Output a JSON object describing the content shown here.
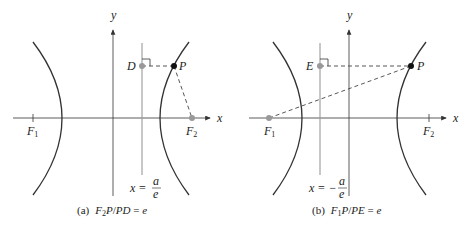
{
  "panels": [
    {
      "id": "a",
      "caption_tag": "(a)",
      "caption_parts": {
        "num": "F",
        "num_sub": "2",
        "num_rest": "P",
        "slash": "/",
        "den": "PD",
        "eq": " = ",
        "e": "e"
      },
      "axis_labels": {
        "x": "x",
        "y": "y"
      },
      "foci": [
        {
          "label": "F",
          "sub": "1",
          "marked": false
        },
        {
          "label": "F",
          "sub": "2",
          "marked": true
        }
      ],
      "point_P": "P",
      "point_on_directrix": "D",
      "directrix": {
        "lhs": "x = ",
        "sign": "",
        "num": "a",
        "den": "e"
      }
    },
    {
      "id": "b",
      "caption_tag": "(b)",
      "caption_parts": {
        "num": "F",
        "num_sub": "1",
        "num_rest": "P",
        "slash": "/",
        "den": "PE",
        "eq": " = ",
        "e": "e"
      },
      "axis_labels": {
        "x": "x",
        "y": "y"
      },
      "foci": [
        {
          "label": "F",
          "sub": "1",
          "marked": true
        },
        {
          "label": "F",
          "sub": "2",
          "marked": false
        }
      ],
      "point_P": "P",
      "point_on_directrix": "E",
      "directrix": {
        "lhs": "x = ",
        "sign": "−",
        "num": "a",
        "den": "e"
      }
    }
  ],
  "colors": {
    "curve": "#333333",
    "axis": "#333333",
    "directrix": "#999999",
    "point_gray": "#999999",
    "point_black": "#111111",
    "dash": "#444444"
  }
}
